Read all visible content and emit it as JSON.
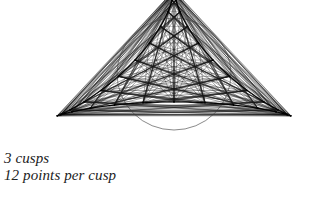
{
  "page": {
    "width": 309,
    "height": 197,
    "background_color": "#ffffff"
  },
  "caption": {
    "line1": "3 cusps",
    "line2": "12 points per cusp",
    "color": "#222222",
    "style": "italic-serif"
  },
  "top_cropped_text": {
    "text": "·    ·    ·    ·",
    "note_visible": "faint descenders of a clipped line of text at the very top edge"
  },
  "chart_data": {
    "type": "line",
    "title": "",
    "subtitle": "",
    "xlabel": "",
    "ylabel": "",
    "grid": false,
    "legend_position": "none",
    "figure_kind": "string-art envelope of a 3-cusped hypocycloid (deltoid)",
    "cusps": 3,
    "points_per_cusp": 12,
    "total_points": 36,
    "stroke_color": "#1a1a1a",
    "stroke_width": 0.45,
    "envelope_stroke_color": "#000000",
    "inner_circle": {
      "visible": true,
      "center_x": 174,
      "center_y": 74,
      "radius_x": 57,
      "radius_y": 56,
      "stroke_color": "#3a3a3a",
      "stroke_width": 0.6
    },
    "cusp_tips": [
      {
        "label": "left-cusp",
        "x": 44,
        "y": 10
      },
      {
        "label": "right-cusp",
        "x": 305,
        "y": 12
      },
      {
        "label": "bottom-cusp",
        "x": 175,
        "y": 252
      }
    ],
    "deltoid": {
      "center_x": 174,
      "center_y": 74,
      "radius": 135,
      "rotation_deg": -90,
      "aspect_y": 0.62,
      "description": "Deltoid traced by x = 2R/3*cos(t) + R/3*cos(2t), y = 2R/3*sin(t) - R/3*sin(2t), rotated so one cusp points down and two cusps point up-left and up-right."
    },
    "chords": {
      "description": "Straight chords connect point i on one cusp arc to point j on the next cusp arc; the accumulated chords envelope the deltoid and the inscribed circle.",
      "families": 3,
      "lines_per_family": 144
    },
    "axis_ranges": {
      "xlim": [
        0,
        309
      ],
      "ylim": [
        0,
        197
      ]
    }
  }
}
